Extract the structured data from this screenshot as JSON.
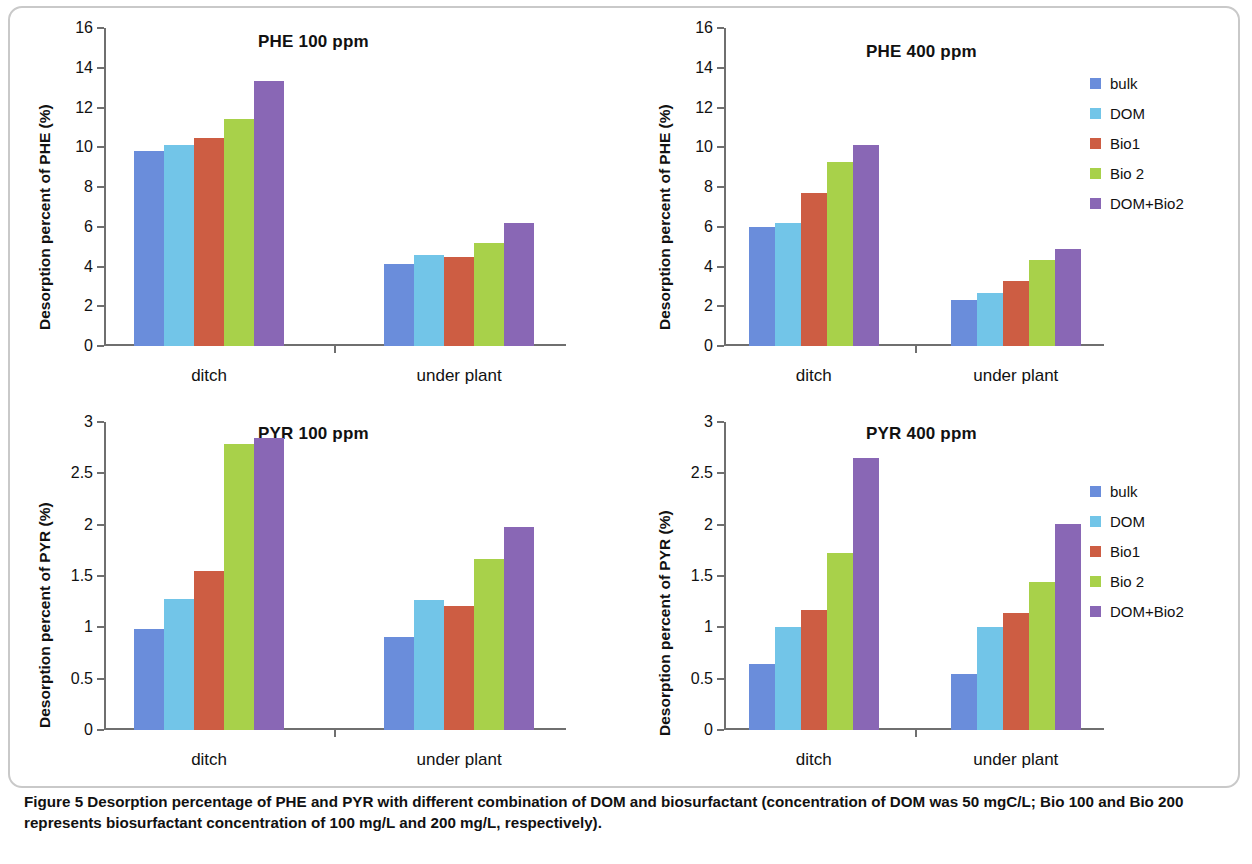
{
  "figure": {
    "caption_label": "Figure 5",
    "caption_text": " Desorption percentage of PHE and PYR with different combination of DOM and biosurfactant (concentration of DOM was 50 mgC/L; Bio 100 and Bio 200 represents biosurfactant concentration of 100 mg/L and 200 mg/L, respectively)."
  },
  "series_colors": {
    "bulk": "#6a8ddb",
    "DOM": "#72c5e8",
    "Bio1": "#cd5d43",
    "Bio 2": "#a8d14a",
    "DOM+Bio2": "#8967b5"
  },
  "legend": {
    "items": [
      {
        "label": "bulk",
        "color": "#6a8ddb"
      },
      {
        "label": "DOM",
        "color": "#72c5e8"
      },
      {
        "label": "Bio1",
        "color": "#cd5d43"
      },
      {
        "label": "Bio 2",
        "color": "#a8d14a"
      },
      {
        "label": "DOM+Bio2",
        "color": "#8967b5"
      }
    ]
  },
  "chart_data": [
    {
      "type": "bar",
      "id": "phe-100",
      "title": "PHE 100 ppm",
      "xlabel": "",
      "ylabel": "Desorption percent of PHE (%)",
      "categories": [
        "ditch",
        "under plant"
      ],
      "ylim": [
        0,
        16
      ],
      "yticks": [
        0,
        2,
        4,
        6,
        8,
        10,
        12,
        14,
        16
      ],
      "ytick_labels": [
        "0",
        "2",
        "4",
        "6",
        "8",
        "10",
        "12",
        "14",
        "16"
      ],
      "grid": false,
      "legend_position": "none",
      "series": [
        {
          "name": "bulk",
          "color": "#6a8ddb",
          "values": [
            9.8,
            4.15
          ]
        },
        {
          "name": "DOM",
          "color": "#72c5e8",
          "values": [
            10.1,
            4.6
          ]
        },
        {
          "name": "Bio1",
          "color": "#cd5d43",
          "values": [
            10.45,
            4.48
          ]
        },
        {
          "name": "Bio 2",
          "color": "#a8d14a",
          "values": [
            11.4,
            5.2
          ]
        },
        {
          "name": "DOM+Bio2",
          "color": "#8967b5",
          "values": [
            13.35,
            6.2
          ]
        }
      ]
    },
    {
      "type": "bar",
      "id": "phe-400",
      "title": "PHE 400 ppm",
      "xlabel": "",
      "ylabel": "Desorption percent of PHE (%)",
      "categories": [
        "ditch",
        "under plant"
      ],
      "ylim": [
        0,
        16
      ],
      "yticks": [
        0,
        2,
        4,
        6,
        8,
        10,
        12,
        14,
        16
      ],
      "ytick_labels": [
        "0",
        "2",
        "4",
        "6",
        "8",
        "10",
        "12",
        "14",
        "16"
      ],
      "grid": false,
      "legend_position": "right",
      "series": [
        {
          "name": "bulk",
          "color": "#6a8ddb",
          "values": [
            5.98,
            2.33
          ]
        },
        {
          "name": "DOM",
          "color": "#72c5e8",
          "values": [
            6.2,
            2.68
          ]
        },
        {
          "name": "Bio1",
          "color": "#cd5d43",
          "values": [
            7.7,
            3.28
          ]
        },
        {
          "name": "Bio 2",
          "color": "#a8d14a",
          "values": [
            9.28,
            4.35
          ]
        },
        {
          "name": "DOM+Bio2",
          "color": "#8967b5",
          "values": [
            10.1,
            4.88
          ]
        }
      ]
    },
    {
      "type": "bar",
      "id": "pyr-100",
      "title": "PYR 100 ppm",
      "xlabel": "",
      "ylabel": "Desorption percent of PYR (%)",
      "categories": [
        "ditch",
        "under plant"
      ],
      "ylim": [
        0,
        3
      ],
      "yticks": [
        0,
        0.5,
        1,
        1.5,
        2,
        2.5,
        3
      ],
      "ytick_labels": [
        "0",
        "0.5",
        "1",
        "1.5",
        "2",
        "2.5",
        "3"
      ],
      "grid": false,
      "legend_position": "none",
      "series": [
        {
          "name": "bulk",
          "color": "#6a8ddb",
          "values": [
            0.98,
            0.91
          ]
        },
        {
          "name": "DOM",
          "color": "#72c5e8",
          "values": [
            1.28,
            1.27
          ]
        },
        {
          "name": "Bio1",
          "color": "#cd5d43",
          "values": [
            1.55,
            1.21
          ]
        },
        {
          "name": "Bio 2",
          "color": "#a8d14a",
          "values": [
            2.79,
            1.67
          ]
        },
        {
          "name": "DOM+Bio2",
          "color": "#8967b5",
          "values": [
            2.84,
            1.98
          ]
        }
      ]
    },
    {
      "type": "bar",
      "id": "pyr-400",
      "title": "PYR 400 ppm",
      "xlabel": "",
      "ylabel": "Desorption percent of PYR  (%)",
      "categories": [
        "ditch",
        "under plant"
      ],
      "ylim": [
        0,
        3
      ],
      "yticks": [
        0,
        0.5,
        1,
        1.5,
        2,
        2.5,
        3
      ],
      "ytick_labels": [
        "0",
        "0.5",
        "1",
        "1.5",
        "2",
        "2.5",
        "3"
      ],
      "grid": false,
      "legend_position": "right",
      "series": [
        {
          "name": "bulk",
          "color": "#6a8ddb",
          "values": [
            0.64,
            0.55
          ]
        },
        {
          "name": "DOM",
          "color": "#72c5e8",
          "values": [
            1.0,
            1.0
          ]
        },
        {
          "name": "Bio1",
          "color": "#cd5d43",
          "values": [
            1.17,
            1.14
          ]
        },
        {
          "name": "Bio 2",
          "color": "#a8d14a",
          "values": [
            1.72,
            1.44
          ]
        },
        {
          "name": "DOM+Bio2",
          "color": "#8967b5",
          "values": [
            2.65,
            2.01
          ]
        }
      ]
    }
  ]
}
